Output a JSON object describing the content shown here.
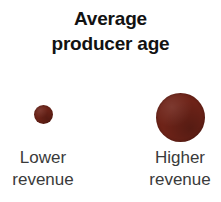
{
  "chart_data": {
    "type": "bubble",
    "title": "Average producer age",
    "title_lines": [
      "Average",
      "producer age"
    ],
    "xlabel": "",
    "ylabel": "",
    "categories": [
      "Lower revenue",
      "Higher revenue"
    ],
    "series": [
      {
        "name": "Average producer age",
        "points": [
          {
            "category": "Lower revenue",
            "label_lines": [
              "Lower",
              "revenue"
            ],
            "bubble_diameter_px": 19,
            "relative_size": 0.39
          },
          {
            "category": "Higher revenue",
            "label_lines": [
              "Higher",
              "revenue"
            ],
            "bubble_diameter_px": 49,
            "relative_size": 1.0
          }
        ]
      }
    ],
    "colors": {
      "bubble": "#6e2318",
      "title": "#121212",
      "label": "#3a3a3a",
      "background": "#ffffff"
    },
    "grid": false,
    "legend": "none",
    "annotations": []
  },
  "title": {
    "line1": "Average",
    "line2": "producer age"
  },
  "groups": [
    {
      "id": "lower",
      "label_line1": "Lower",
      "label_line2": "revenue"
    },
    {
      "id": "higher",
      "label_line1": "Higher",
      "label_line2": "revenue"
    }
  ]
}
